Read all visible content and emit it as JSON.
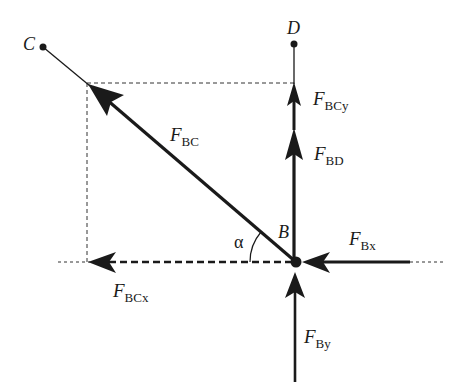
{
  "diagram": {
    "type": "free-body force diagram",
    "points": {
      "C": "C",
      "D": "D",
      "B": "B"
    },
    "angle_label": "α",
    "forces": [
      {
        "id": "FBC",
        "symbol": "F",
        "subscript": "BC",
        "direction": "up-left toward C"
      },
      {
        "id": "FBCy",
        "symbol": "F",
        "subscript": "BCy",
        "direction": "up (vertical component)"
      },
      {
        "id": "FBD",
        "symbol": "F",
        "subscript": "BD",
        "direction": "up toward D"
      },
      {
        "id": "FBx",
        "symbol": "F",
        "subscript": "Bx",
        "direction": "left"
      },
      {
        "id": "FBCx",
        "symbol": "F",
        "subscript": "BCx",
        "direction": "left (horizontal component, dashed)"
      },
      {
        "id": "FBy",
        "symbol": "F",
        "subscript": "By",
        "direction": "up"
      }
    ],
    "colors": {
      "line": "#1a1a1a",
      "dashed": "#333333",
      "background": "#ffffff"
    }
  }
}
